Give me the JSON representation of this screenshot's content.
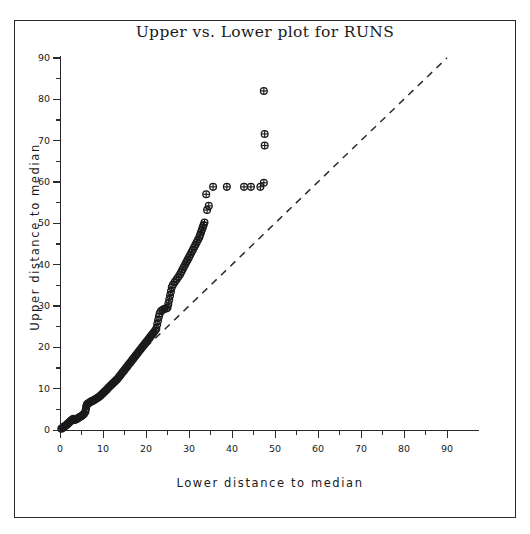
{
  "chart_data": {
    "type": "scatter",
    "title": "Upper vs. Lower plot for RUNS",
    "xlabel": "Lower distance to median",
    "ylabel": "Upper distance to median",
    "xlim": [
      0,
      90
    ],
    "ylim": [
      0,
      90
    ],
    "xticks": [
      0,
      10,
      20,
      30,
      40,
      50,
      60,
      70,
      80,
      90
    ],
    "yticks": [
      0,
      10,
      20,
      30,
      40,
      50,
      60,
      70,
      80,
      90
    ],
    "grid": false,
    "legend": null,
    "marker": "circle-plus",
    "marker_color": "#1a1a1a",
    "series": [
      {
        "name": "Upper vs Lower",
        "points": [
          [
            0.3,
            0.3
          ],
          [
            0.5,
            0.4
          ],
          [
            0.7,
            0.6
          ],
          [
            0.9,
            0.8
          ],
          [
            1.1,
            0.9
          ],
          [
            1.3,
            1.1
          ],
          [
            1.5,
            1.2
          ],
          [
            1.7,
            1.4
          ],
          [
            1.9,
            1.6
          ],
          [
            2.1,
            1.8
          ],
          [
            2.3,
            2.0
          ],
          [
            2.5,
            2.2
          ],
          [
            2.7,
            2.4
          ],
          [
            2.9,
            2.5
          ],
          [
            3.1,
            2.7
          ],
          [
            3.3,
            2.4
          ],
          [
            3.5,
            2.5
          ],
          [
            3.7,
            2.6
          ],
          [
            3.9,
            2.7
          ],
          [
            4.1,
            2.8
          ],
          [
            4.4,
            3.0
          ],
          [
            4.7,
            3.2
          ],
          [
            5.0,
            3.4
          ],
          [
            5.3,
            3.6
          ],
          [
            5.6,
            3.9
          ],
          [
            5.9,
            4.4
          ],
          [
            6.0,
            5.0
          ],
          [
            6.1,
            5.6
          ],
          [
            6.2,
            6.0
          ],
          [
            6.3,
            6.2
          ],
          [
            6.5,
            6.4
          ],
          [
            6.8,
            6.6
          ],
          [
            7.1,
            6.8
          ],
          [
            7.4,
            7.0
          ],
          [
            7.7,
            7.1
          ],
          [
            8.0,
            7.3
          ],
          [
            8.3,
            7.5
          ],
          [
            8.6,
            7.7
          ],
          [
            8.9,
            7.9
          ],
          [
            9.2,
            8.1
          ],
          [
            9.5,
            8.4
          ],
          [
            9.8,
            8.7
          ],
          [
            10.1,
            9.0
          ],
          [
            10.4,
            9.3
          ],
          [
            10.7,
            9.6
          ],
          [
            11.0,
            9.9
          ],
          [
            11.3,
            10.3
          ],
          [
            11.6,
            10.6
          ],
          [
            11.9,
            10.9
          ],
          [
            12.2,
            11.2
          ],
          [
            12.5,
            11.5
          ],
          [
            12.8,
            11.8
          ],
          [
            13.1,
            12.1
          ],
          [
            13.4,
            12.4
          ],
          [
            13.7,
            12.8
          ],
          [
            14.0,
            13.2
          ],
          [
            14.3,
            13.6
          ],
          [
            14.6,
            14.0
          ],
          [
            14.9,
            14.4
          ],
          [
            15.2,
            14.8
          ],
          [
            15.5,
            15.2
          ],
          [
            15.8,
            15.6
          ],
          [
            16.1,
            16.0
          ],
          [
            16.4,
            16.4
          ],
          [
            16.7,
            16.8
          ],
          [
            17.0,
            17.2
          ],
          [
            17.3,
            17.6
          ],
          [
            17.6,
            18.0
          ],
          [
            17.9,
            18.4
          ],
          [
            18.2,
            18.8
          ],
          [
            18.5,
            19.2
          ],
          [
            18.8,
            19.6
          ],
          [
            19.1,
            20.0
          ],
          [
            19.4,
            20.4
          ],
          [
            19.7,
            20.8
          ],
          [
            20.0,
            21.2
          ],
          [
            20.3,
            21.6
          ],
          [
            20.6,
            22.0
          ],
          [
            20.9,
            22.4
          ],
          [
            21.2,
            22.8
          ],
          [
            21.5,
            23.2
          ],
          [
            21.8,
            23.6
          ],
          [
            22.1,
            24.0
          ],
          [
            22.4,
            24.5
          ],
          [
            22.6,
            25.5
          ],
          [
            22.8,
            26.5
          ],
          [
            23.0,
            27.4
          ],
          [
            23.2,
            28.2
          ],
          [
            23.5,
            28.8
          ],
          [
            23.9,
            29.1
          ],
          [
            24.3,
            29.3
          ],
          [
            24.7,
            29.4
          ],
          [
            25.0,
            29.6
          ],
          [
            25.2,
            30.5
          ],
          [
            25.4,
            31.5
          ],
          [
            25.6,
            32.5
          ],
          [
            25.8,
            33.5
          ],
          [
            26.0,
            34.5
          ],
          [
            26.3,
            35.2
          ],
          [
            26.7,
            35.8
          ],
          [
            27.1,
            36.4
          ],
          [
            27.5,
            37.0
          ],
          [
            27.9,
            37.6
          ],
          [
            28.2,
            38.2
          ],
          [
            28.5,
            38.8
          ],
          [
            28.8,
            39.4
          ],
          [
            29.1,
            40.0
          ],
          [
            29.4,
            40.6
          ],
          [
            29.7,
            41.2
          ],
          [
            30.0,
            41.8
          ],
          [
            30.3,
            42.4
          ],
          [
            30.6,
            43.0
          ],
          [
            30.9,
            43.6
          ],
          [
            31.2,
            44.2
          ],
          [
            31.5,
            44.8
          ],
          [
            31.8,
            45.4
          ],
          [
            32.1,
            46.0
          ],
          [
            32.4,
            46.6
          ],
          [
            32.6,
            47.2
          ],
          [
            32.8,
            47.8
          ],
          [
            33.0,
            48.4
          ],
          [
            33.2,
            49.0
          ],
          [
            33.4,
            49.6
          ],
          [
            33.6,
            50.2
          ],
          [
            34.2,
            53.2
          ],
          [
            34.6,
            54.2
          ],
          [
            34.0,
            57.0
          ],
          [
            35.6,
            58.8
          ],
          [
            38.8,
            58.8
          ],
          [
            42.8,
            58.8
          ],
          [
            44.4,
            58.8
          ],
          [
            46.6,
            58.8
          ],
          [
            47.4,
            59.8
          ],
          [
            47.6,
            68.8
          ],
          [
            47.6,
            71.6
          ],
          [
            47.4,
            82.0
          ]
        ]
      }
    ],
    "reference_line": {
      "type": "dashed",
      "description": "y = x identity line",
      "from": [
        20,
        20
      ],
      "to": [
        90,
        90
      ],
      "color": "#2a2a2a"
    }
  }
}
